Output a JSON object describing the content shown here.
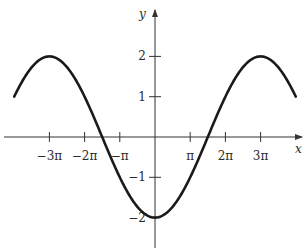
{
  "chart_data": {
    "type": "line",
    "title": "",
    "function": "y = -2cos(x/3)",
    "xlabel": "x",
    "ylabel": "y",
    "xlim": [
      -12.566,
      12.566
    ],
    "ylim": [
      -2,
      2
    ],
    "grid": false,
    "x_ticks": [
      {
        "value": -9.4248,
        "label": "−3π"
      },
      {
        "value": -6.2832,
        "label": "−2π"
      },
      {
        "value": -3.1416,
        "label": "−π"
      },
      {
        "value": 3.1416,
        "label": "π"
      },
      {
        "value": 6.2832,
        "label": "2π"
      },
      {
        "value": 9.4248,
        "label": "3π"
      }
    ],
    "y_ticks": [
      {
        "value": 2,
        "label": "2"
      },
      {
        "value": 1,
        "label": "1"
      },
      {
        "value": -1,
        "label": "−1"
      },
      {
        "value": -2,
        "label": "−2"
      }
    ],
    "series": [
      {
        "name": "curve",
        "x": [
          -12.566,
          -9.425,
          -4.712,
          0,
          4.712,
          9.425,
          12.566
        ],
        "values": [
          1,
          2,
          0,
          -2,
          0,
          2,
          1
        ]
      }
    ],
    "key_points": {
      "maxima": [
        [
          -9.4248,
          2
        ],
        [
          9.4248,
          2
        ]
      ],
      "minimum": [
        0,
        -2
      ],
      "zeros": [
        -4.7124,
        4.7124
      ],
      "endpoints": [
        [
          -12.566,
          1
        ],
        [
          12.566,
          1
        ]
      ]
    },
    "colors": {
      "curve": "#1a1a1a",
      "axes": "#333333"
    }
  }
}
